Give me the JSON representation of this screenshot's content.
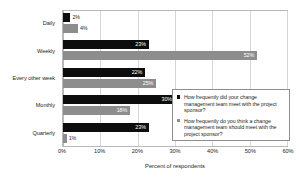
{
  "chart_data": {
    "type": "bar",
    "orientation": "horizontal",
    "title": "",
    "xlabel": "Percent of respondents",
    "ylabel": "",
    "xlim": [
      0,
      60
    ],
    "xtick_labels": [
      "0%",
      "10%",
      "20%",
      "30%",
      "40%",
      "50%",
      "60%"
    ],
    "xtick_values": [
      0,
      10,
      20,
      30,
      40,
      50,
      60
    ],
    "grid": "vertical",
    "legend_position": "inside-right",
    "categories": [
      "Daily",
      "Weekly",
      "Every other week",
      "Monthly",
      "Quarterly"
    ],
    "series": [
      {
        "name": "How frequently did your change management team meet with the project sponsor?",
        "color": "#0d0d0d",
        "values": [
          2,
          23,
          22,
          30,
          23
        ],
        "labels": [
          "2%",
          "23%",
          "22%",
          "30%",
          "23%"
        ]
      },
      {
        "name": "How frequently do you think a change management team should meet with the project sponsor?",
        "color": "#8d8d8d",
        "values": [
          4,
          52,
          25,
          18,
          1
        ],
        "labels": [
          "4%",
          "52%",
          "25%",
          "18%",
          "1%"
        ]
      }
    ]
  },
  "legend": {
    "entries": [
      "How frequently did your change management team meet with the project sponsor?",
      "How frequently do you think a change management team should meet with the project sponsor?"
    ]
  }
}
